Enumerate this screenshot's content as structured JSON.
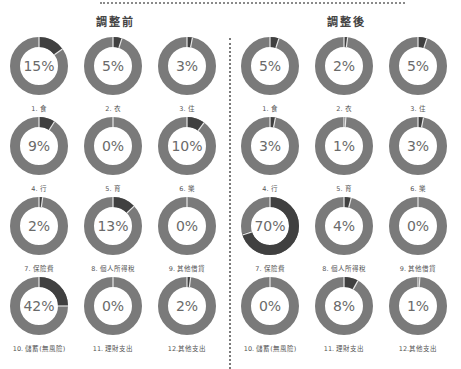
{
  "colors": {
    "ring_base": "#7a7a7a",
    "ring_highlight": "#404040",
    "gap": "#e8e8e8",
    "text": "#6a6a6a"
  },
  "panels": [
    {
      "title": "調整前",
      "items": [
        {
          "label": "1. 食",
          "pct": 15,
          "display": "15%"
        },
        {
          "label": "2. 衣",
          "pct": 5,
          "display": "5%"
        },
        {
          "label": "3. 住",
          "pct": 3,
          "display": "3%"
        },
        {
          "label": "4. 行",
          "pct": 9,
          "display": "9%"
        },
        {
          "label": "5. 育",
          "pct": 0,
          "display": "0%"
        },
        {
          "label": "6. 樂",
          "pct": 10,
          "display": "10%"
        },
        {
          "label": "7. 保險費",
          "pct": 2,
          "display": "2%"
        },
        {
          "label": "8. 個人所得稅",
          "pct": 13,
          "display": "13%"
        },
        {
          "label": "9. 其他借貸",
          "pct": 0,
          "display": "0%"
        },
        {
          "label": "10. 儲蓄(無風險)",
          "pct": 42,
          "arc": 25,
          "display": "42%"
        },
        {
          "label": "11. 理財支出",
          "pct": 0,
          "display": "0%"
        },
        {
          "label": "12.其他支出",
          "pct": 2,
          "display": "2%"
        }
      ]
    },
    {
      "title": "調整後",
      "items": [
        {
          "label": "1. 食",
          "pct": 5,
          "display": "5%"
        },
        {
          "label": "2. 衣",
          "pct": 2,
          "display": "2%"
        },
        {
          "label": "3. 住",
          "pct": 5,
          "display": "5%"
        },
        {
          "label": "4. 行",
          "pct": 3,
          "display": "3%"
        },
        {
          "label": "5. 育",
          "pct": 1,
          "display": "1%"
        },
        {
          "label": "6. 樂",
          "pct": 3,
          "display": "3%"
        },
        {
          "label": "7. 保險費",
          "pct": 70,
          "display": "70%"
        },
        {
          "label": "8. 個人所得稅",
          "pct": 4,
          "display": "4%"
        },
        {
          "label": "9. 其他借貸",
          "pct": 0,
          "display": "0%"
        },
        {
          "label": "10. 儲蓄(無風險)",
          "pct": 0,
          "display": "0%"
        },
        {
          "label": "11. 理財支出",
          "pct": 8,
          "display": "8%"
        },
        {
          "label": "12.其他支出",
          "pct": 1,
          "display": "1%"
        }
      ]
    }
  ],
  "chart_data": [
    {
      "type": "pie",
      "title": "調整前",
      "categories": [
        "1. 食",
        "2. 衣",
        "3. 住",
        "4. 行",
        "5. 育",
        "6. 樂",
        "7. 保險費",
        "8. 個人所得稅",
        "9. 其他借貸",
        "10. 儲蓄(無風險)",
        "11. 理財支出",
        "12.其他支出"
      ],
      "values": [
        15,
        5,
        3,
        9,
        0,
        10,
        2,
        13,
        0,
        42,
        0,
        2
      ],
      "unit": "%"
    },
    {
      "type": "pie",
      "title": "調整後",
      "categories": [
        "1. 食",
        "2. 衣",
        "3. 住",
        "4. 行",
        "5. 育",
        "6. 樂",
        "7. 保險費",
        "8. 個人所得稅",
        "9. 其他借貸",
        "10. 儲蓄(無風險)",
        "11. 理財支出",
        "12.其他支出"
      ],
      "values": [
        5,
        2,
        5,
        3,
        1,
        3,
        70,
        4,
        0,
        0,
        8,
        1
      ],
      "unit": "%"
    }
  ]
}
